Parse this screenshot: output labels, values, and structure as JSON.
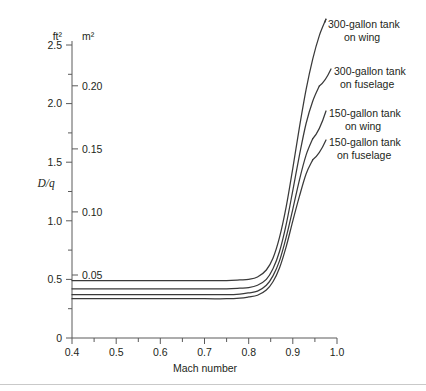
{
  "chart_data": {
    "type": "line",
    "title": "",
    "xlabel": "Mach number",
    "ylabel": "D/q",
    "ylabel_unit_left": "ft²",
    "ylabel_unit_right": "m²",
    "xlim": [
      0.4,
      1.0
    ],
    "ylim": [
      0.0,
      2.7
    ],
    "grid": false,
    "legend_position": "right-inline-labels",
    "x_ticks": [
      0.4,
      0.5,
      0.6,
      0.7,
      0.8,
      0.9,
      1.0
    ],
    "x_tick_labels": [
      "0.4",
      "0.5",
      "0.6",
      "0.7",
      "0.8",
      "0.9",
      "1.0"
    ],
    "x_minor_ticks": [
      0.45,
      0.55,
      0.65,
      0.75,
      0.85,
      0.95
    ],
    "y_ticks_left": [
      0.0,
      0.5,
      1.0,
      1.5,
      2.0,
      2.5
    ],
    "y_tick_labels_left": [
      "0",
      "0.5",
      "1.0",
      "1.5",
      "2.0",
      "2.5"
    ],
    "y_minor_ticks_left": [
      0.25,
      0.75,
      1.25,
      1.75,
      2.25
    ],
    "y_ticks_right_m2": [
      0.05,
      0.1,
      0.15,
      0.2
    ],
    "y_tick_labels_right": [
      "0.05",
      "0.10",
      "0.15",
      "0.20"
    ],
    "m2_per_ft2": 0.0929,
    "series": [
      {
        "name": "300-gallon tank on wing",
        "label_line1": "300-gallon tank",
        "label_line2": "on wing",
        "baseline_ft2": 0.49,
        "x": [
          0.4,
          0.5,
          0.6,
          0.7,
          0.75,
          0.78,
          0.8,
          0.82,
          0.84,
          0.855,
          0.87,
          0.885,
          0.9,
          0.915,
          0.93,
          0.945,
          0.96,
          0.975
        ],
        "values": [
          0.49,
          0.49,
          0.49,
          0.49,
          0.49,
          0.495,
          0.5,
          0.52,
          0.58,
          0.68,
          0.86,
          1.12,
          1.45,
          1.8,
          2.12,
          2.38,
          2.58,
          2.72
        ]
      },
      {
        "name": "300-gallon tank on fuselage",
        "label_line1": "300-gallon tank",
        "label_line2": "on fuselage",
        "baseline_ft2": 0.42,
        "x": [
          0.4,
          0.5,
          0.6,
          0.7,
          0.75,
          0.78,
          0.8,
          0.82,
          0.84,
          0.855,
          0.87,
          0.885,
          0.9,
          0.915,
          0.93,
          0.945,
          0.96
        ],
        "values": [
          0.42,
          0.42,
          0.42,
          0.42,
          0.42,
          0.425,
          0.43,
          0.45,
          0.5,
          0.59,
          0.74,
          0.97,
          1.26,
          1.56,
          1.83,
          2.02,
          2.15
        ]
      },
      {
        "name": "150-gallon tank on wing",
        "label_line1": "150-gallon tank",
        "label_line2": "on wing",
        "baseline_ft2": 0.37,
        "x": [
          0.4,
          0.5,
          0.6,
          0.7,
          0.75,
          0.78,
          0.8,
          0.82,
          0.84,
          0.855,
          0.87,
          0.885,
          0.9,
          0.915,
          0.93,
          0.945
        ],
        "values": [
          0.37,
          0.37,
          0.37,
          0.37,
          0.37,
          0.375,
          0.385,
          0.4,
          0.45,
          0.53,
          0.66,
          0.86,
          1.1,
          1.35,
          1.56,
          1.7
        ]
      },
      {
        "name": "150-gallon tank on fuselage",
        "label_line1": "150-gallon tank",
        "label_line2": "on fuselage",
        "baseline_ft2": 0.335,
        "x": [
          0.4,
          0.5,
          0.6,
          0.7,
          0.75,
          0.78,
          0.8,
          0.82,
          0.84,
          0.855,
          0.87,
          0.885,
          0.9,
          0.915,
          0.93,
          0.945
        ],
        "values": [
          0.335,
          0.335,
          0.335,
          0.335,
          0.335,
          0.34,
          0.35,
          0.365,
          0.41,
          0.48,
          0.6,
          0.78,
          1.0,
          1.21,
          1.4,
          1.52
        ]
      }
    ]
  },
  "colors": {
    "curve": "#3a3a3a",
    "axis": "#5a5a5a",
    "text": "#231f20",
    "background": "#ffffff",
    "footer_rule": "#c9c9c9"
  }
}
